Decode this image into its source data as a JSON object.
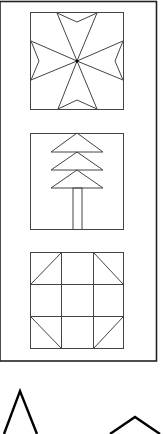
{
  "figure": {
    "colors": {
      "line": "#444444",
      "frame": "#222222",
      "bold": "#000000",
      "background": "#ffffff"
    },
    "panel_items": [
      {
        "name": "maltese-cross-block",
        "label": ""
      },
      {
        "name": "pine-tree-block",
        "label": ""
      },
      {
        "name": "shoofly-block",
        "label": ""
      }
    ],
    "below_frame_shapes": [
      {
        "name": "triangle-outline"
      },
      {
        "name": "chevron-outline"
      }
    ]
  }
}
